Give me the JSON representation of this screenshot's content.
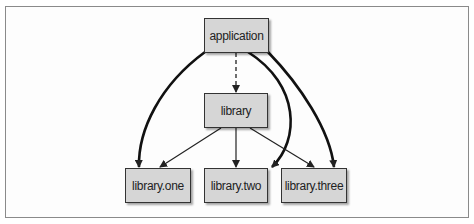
{
  "diagram": {
    "nodes": {
      "application": {
        "label": "application"
      },
      "library": {
        "label": "library"
      },
      "library_one": {
        "label": "library.one"
      },
      "library_two": {
        "label": "library.two"
      },
      "library_three": {
        "label": "library.three"
      }
    },
    "edges": [
      {
        "from": "application",
        "to": "library",
        "style": "dashed"
      },
      {
        "from": "application",
        "to": "library.one",
        "style": "thick"
      },
      {
        "from": "application",
        "to": "library.two",
        "style": "thick"
      },
      {
        "from": "application",
        "to": "library.three",
        "style": "thick"
      },
      {
        "from": "library",
        "to": "library.one",
        "style": "thin"
      },
      {
        "from": "library",
        "to": "library.two",
        "style": "thin"
      },
      {
        "from": "library",
        "to": "library.three",
        "style": "thin"
      }
    ],
    "colors": {
      "node_fill": "#d6d6d6",
      "stroke": "#222222",
      "frame": "#8a8a8a"
    }
  }
}
